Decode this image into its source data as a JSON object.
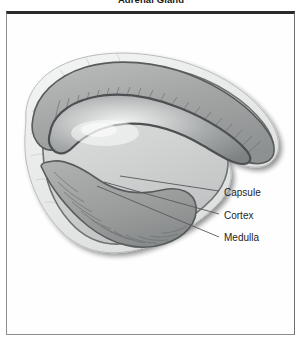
{
  "figure": {
    "title": "Adrenal Gland",
    "type": "anatomical-cross-section-diagram"
  },
  "panel": {
    "background_color": "#fefefe",
    "border_color": "#2b2b2b"
  },
  "callouts": [
    {
      "id": "capsule",
      "label": "Capsule",
      "label_x": 224,
      "label_y": 193,
      "leader_from_x": 120,
      "leader_from_y": 176,
      "leader_to_x": 219,
      "leader_to_y": 191
    },
    {
      "id": "cortex",
      "label": "Cortex",
      "label_x": 224,
      "label_y": 215,
      "leader_from_x": 104,
      "leader_from_y": 182,
      "leader_to_x": 219,
      "leader_to_y": 214
    },
    {
      "id": "medulla",
      "label": "Medulla",
      "label_x": 224,
      "label_y": 238,
      "leader_from_x": 97,
      "leader_from_y": 186,
      "leader_to_x": 219,
      "leader_to_y": 237
    }
  ],
  "anatomy": {
    "layers": [
      {
        "name": "fat-pad",
        "description": "pale lobulated perirenal fat surrounding capsule",
        "color": "#e9eaea"
      },
      {
        "name": "capsule",
        "description": "thin outer fibrous capsule band",
        "color": "#cfd1d1"
      },
      {
        "name": "cortex",
        "description": "striated cortical layer with radial columns",
        "color": "#a2a4a4"
      },
      {
        "name": "medulla",
        "description": "dark inner medulla core with central highlight",
        "color": "#8c8f90"
      }
    ],
    "outline_color": "#5d6061",
    "shadow_color": "#b9bbbb"
  },
  "colors": {
    "ink": "#1d1d1d",
    "leader_line": "#55585a",
    "frame": "#2b2b2b",
    "page_background": "#ffffff"
  }
}
